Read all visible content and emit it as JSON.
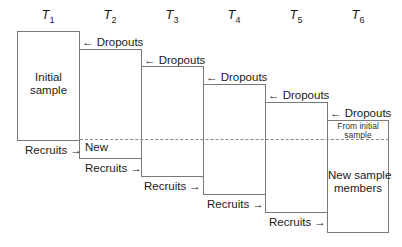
{
  "periods": [
    {
      "base": "T",
      "sub": "1"
    },
    {
      "base": "T",
      "sub": "2"
    },
    {
      "base": "T",
      "sub": "3"
    },
    {
      "base": "T",
      "sub": "4"
    },
    {
      "base": "T",
      "sub": "5"
    },
    {
      "base": "T",
      "sub": "6"
    }
  ],
  "boxes": {
    "initial_sample_line1": "Initial",
    "initial_sample_line2": "sample",
    "new": "New",
    "from_initial_line1": "From initial",
    "from_initial_line2": "sample",
    "new_members_line1": "New sample",
    "new_members_line2": "members"
  },
  "labels": {
    "dropouts": "← Dropouts",
    "recruits": "Recruits →"
  }
}
